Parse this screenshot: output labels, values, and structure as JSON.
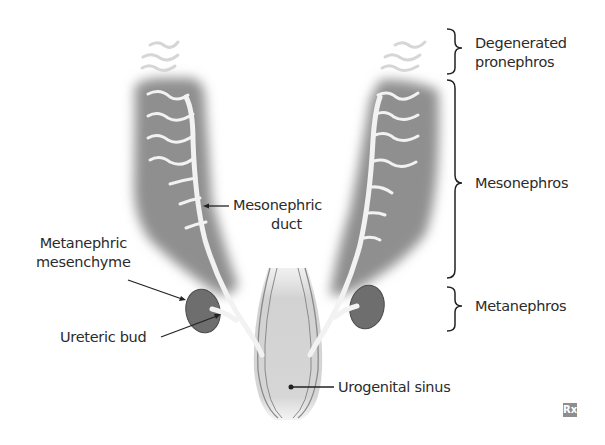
{
  "diagram": {
    "labels": {
      "degenerated_pronephros_line1": "Degenerated",
      "degenerated_pronephros_line2": "pronephros",
      "mesonephros": "Mesonephros",
      "metanephros": "Metanephros",
      "mesonephric_duct_line1": "Mesonephric",
      "mesonephric_duct_line2": "duct",
      "metanephric_mesenchyme_line1": "Metanephric",
      "metanephric_mesenchyme_line2": "mesenchyme",
      "ureteric_bud": "Ureteric bud",
      "urogenital_sinus": "Urogenital sinus"
    },
    "logo": "Rx",
    "colors": {
      "mesonephros_lobe": "#8f8f8f",
      "duct": "#f2f2f2",
      "metanephros": "#6e6e6e",
      "urogenital_sinus": "#d4d4d4",
      "text": "#2b2b2b"
    }
  }
}
